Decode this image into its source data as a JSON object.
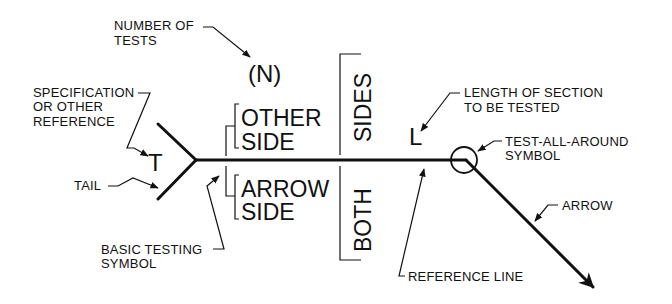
{
  "diagram": {
    "type": "nondestructive-testing-symbol",
    "labels": {
      "number_of_tests_1": "NUMBER OF",
      "number_of_tests_2": "TESTS",
      "spec_1": "SPECIFICATION",
      "spec_2": "OR OTHER",
      "spec_3": "REFERENCE",
      "tail": "TAIL",
      "basic_1": "BASIC TESTING",
      "basic_2": "SYMBOL",
      "length_1": "LENGTH OF SECTION",
      "length_2": "TO BE TESTED",
      "taa_1": "TEST-ALL-AROUND",
      "taa_2": "SYMBOL",
      "arrow": "ARROW",
      "reference_line": "REFERENCE LINE"
    },
    "symbols": {
      "n": "(N)",
      "t": "T",
      "l": "L",
      "other_1": "OTHER",
      "other_2": "SIDE",
      "arrow_1": "ARROW",
      "arrow_2": "SIDE",
      "sides": "SIDES",
      "both": "BOTH"
    },
    "colors": {
      "ink": "#111111",
      "background": "#ffffff"
    }
  }
}
